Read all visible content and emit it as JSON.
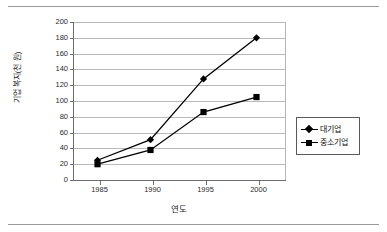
{
  "figure": {
    "rules": [
      "top-rule",
      "bottom-rule"
    ]
  },
  "chart_data": {
    "type": "line",
    "title": "",
    "xlabel": "연도",
    "ylabel": "기업 복지(천 원)",
    "categories": [
      "1985",
      "1990",
      "1995",
      "2000"
    ],
    "x": [
      1985,
      1990,
      1995,
      2000
    ],
    "series": [
      {
        "name": "대기업",
        "marker": "diamond",
        "values": [
          25,
          51,
          128,
          180
        ]
      },
      {
        "name": "중소기업",
        "marker": "square",
        "values": [
          20,
          38,
          86,
          105
        ]
      }
    ],
    "ylim": [
      0,
      200
    ],
    "yticks": [
      0,
      20,
      40,
      60,
      80,
      100,
      120,
      140,
      160,
      180,
      200
    ],
    "ytick_labels": [
      "0",
      "20",
      "40",
      "60",
      "80",
      "100",
      "120",
      "140",
      "160",
      "180",
      "200"
    ],
    "grid": true,
    "legend_position": "right-outside",
    "line_color": "#000000",
    "grid_color": "#b9b9b9",
    "axis_color": "#6d6d6d"
  }
}
